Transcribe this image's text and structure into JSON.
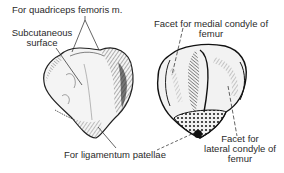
{
  "diagram": {
    "subject": "Patella",
    "views": [
      {
        "name": "anterior",
        "position": "left"
      },
      {
        "name": "posterior",
        "position": "right"
      }
    ],
    "labels": {
      "quadriceps": "For quadriceps femoris m.",
      "subcutaneous_line1": "Subcutaneous",
      "subcutaneous_line2": "surface",
      "medial_facet_line1": "Facet for medial condyle of",
      "medial_facet_line2": "femur",
      "ligamentum": "For ligamentum patellae",
      "lateral_facet_line1": "Facet for",
      "lateral_facet_line2": "lateral condyle of",
      "lateral_facet_line3": "femur"
    },
    "colors": {
      "ink": "#1a1a1a",
      "background": "#ffffff"
    }
  }
}
